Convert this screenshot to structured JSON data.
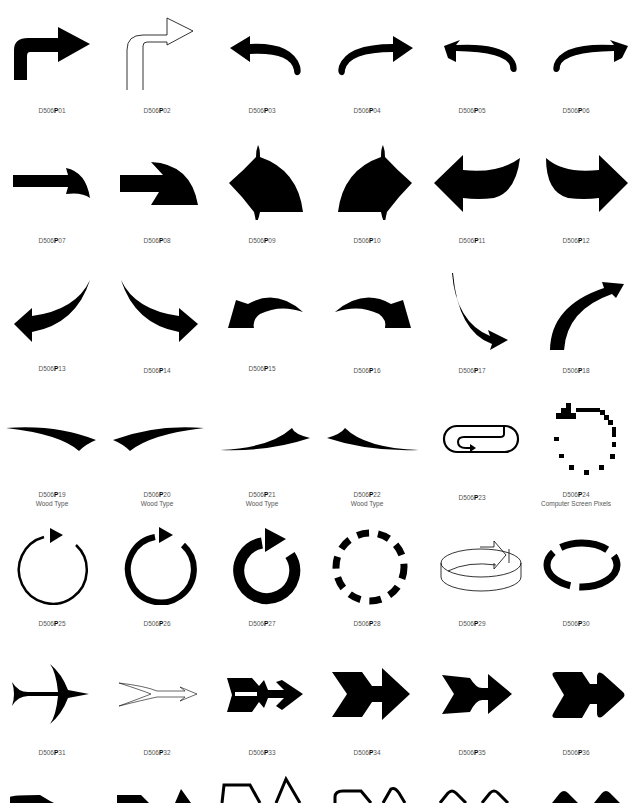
{
  "catalog": {
    "prefix": "D506",
    "series": "P",
    "items": [
      {
        "code": "01",
        "icon": "bent-arrow-up-right-icon"
      },
      {
        "code": "02",
        "icon": "outline-bent-arrow-icon"
      },
      {
        "code": "03",
        "icon": "hook-arrow-left-icon"
      },
      {
        "code": "04",
        "icon": "hook-arrow-right-icon"
      },
      {
        "code": "05",
        "icon": "hook-arrow-left-thin-icon"
      },
      {
        "code": "06",
        "icon": "hook-arrow-right-thin-icon"
      },
      {
        "code": "07",
        "icon": "arrow-curved-head-small-icon"
      },
      {
        "code": "08",
        "icon": "arrow-curved-head-large-icon"
      },
      {
        "code": "09",
        "icon": "arrow-left-wing-icon"
      },
      {
        "code": "10",
        "icon": "arrow-right-wing-icon"
      },
      {
        "code": "11",
        "icon": "curved-arrow-left-icon"
      },
      {
        "code": "12",
        "icon": "curved-arrow-right-icon"
      },
      {
        "code": "13",
        "icon": "swoosh-arrow-down-left-icon"
      },
      {
        "code": "14",
        "icon": "swoosh-arrow-down-right-icon"
      },
      {
        "code": "15",
        "icon": "arc-arrow-left-icon"
      },
      {
        "code": "16",
        "icon": "arc-arrow-right-icon"
      },
      {
        "code": "17",
        "icon": "thin-curve-arrow-down-icon"
      },
      {
        "code": "18",
        "icon": "arc-arrow-up-right-icon"
      },
      {
        "code": "19",
        "icon": "wood-type-swash-right-icon",
        "note": "Wood Type"
      },
      {
        "code": "20",
        "icon": "wood-type-swash-left-icon",
        "note": "Wood Type"
      },
      {
        "code": "21",
        "icon": "wood-type-swash-up-icon",
        "note": "Wood Type"
      },
      {
        "code": "22",
        "icon": "wood-type-swash-down-icon",
        "note": "Wood Type"
      },
      {
        "code": "23",
        "icon": "loop-arrow-icon"
      },
      {
        "code": "24",
        "icon": "pixel-circle-arrow-icon",
        "note": "Computer Screen Pixels"
      },
      {
        "code": "25",
        "icon": "circle-arrow-thin-icon"
      },
      {
        "code": "26",
        "icon": "circle-arrow-medium-icon"
      },
      {
        "code": "27",
        "icon": "circle-arrow-thick-icon"
      },
      {
        "code": "28",
        "icon": "dashed-circle-arrows-icon"
      },
      {
        "code": "29",
        "icon": "3d-ring-arrow-icon"
      },
      {
        "code": "30",
        "icon": "split-ring-arrows-icon"
      },
      {
        "code": "31",
        "icon": "fletched-arrow-icon"
      },
      {
        "code": "32",
        "icon": "outline-fletched-arrow-icon"
      },
      {
        "code": "33",
        "icon": "feathered-arrow-icon"
      },
      {
        "code": "34",
        "icon": "chevron-tail-arrow-icon"
      },
      {
        "code": "35",
        "icon": "chevron-tail-arrow-narrow-icon"
      },
      {
        "code": "36",
        "icon": "chevron-tail-arrow-rounded-icon"
      }
    ]
  }
}
